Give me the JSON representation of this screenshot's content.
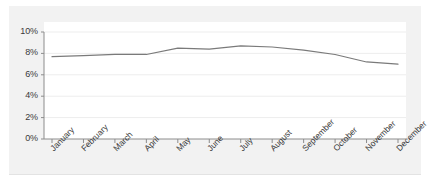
{
  "chart_data": {
    "type": "line",
    "title": "",
    "subtitle": "",
    "xlabel": "",
    "ylabel": "",
    "categories": [
      "January",
      "February",
      "March",
      "April",
      "May",
      "June",
      "July",
      "August",
      "September",
      "October",
      "November",
      "December"
    ],
    "values": [
      7.7,
      7.8,
      7.9,
      7.9,
      8.5,
      8.4,
      8.7,
      8.6,
      8.3,
      7.9,
      7.2,
      7.0
    ],
    "series": [
      {
        "name": "",
        "values": [
          7.7,
          7.8,
          7.9,
          7.9,
          8.5,
          8.4,
          8.7,
          8.6,
          8.3,
          7.9,
          7.2,
          7.0
        ]
      }
    ],
    "ylim": [
      0,
      10
    ],
    "y_ticks": [
      0,
      2,
      4,
      6,
      8,
      10
    ],
    "y_tick_labels": [
      "0%",
      "2%",
      "4%",
      "6%",
      "8%",
      "10%"
    ],
    "x_tick_labels": [
      "January",
      "February",
      "March",
      "April",
      "May",
      "June",
      "July",
      "August",
      "September",
      "October",
      "November",
      "December"
    ],
    "grid": true,
    "legend": "none",
    "annotations": []
  },
  "style": {
    "line_color": "#7a7a7a",
    "grid_color": "#ededed",
    "axis_color": "#8c8c8c",
    "plot_background": "#ffffff",
    "figure_background": "#f2f2f2",
    "page_background": "#ffffff",
    "tick_label_color": "#3a3a3a"
  }
}
